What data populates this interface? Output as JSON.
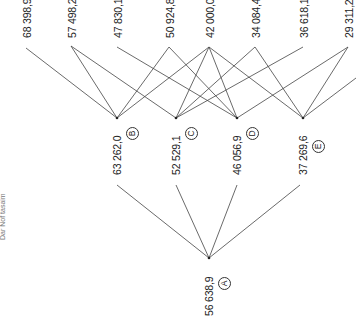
{
  "side_label": "Dar Nof tasaim",
  "top_values": [
    {
      "label": "68 398,9",
      "x": 26
    },
    {
      "label": "57 498,2",
      "x": 71
    },
    {
      "label": "47 830,1",
      "x": 117
    },
    {
      "label": "50 924,8",
      "x": 169
    },
    {
      "label": "42 000,0",
      "x": 209
    },
    {
      "label": "34 084,4",
      "x": 255
    },
    {
      "label": "36 618,1",
      "x": 303
    },
    {
      "label": "29 311,2",
      "x": 348
    }
  ],
  "middle_nodes": [
    {
      "id": "B",
      "value": "63 262,0",
      "x": 117
    },
    {
      "id": "C",
      "value": "52 529,1",
      "x": 176
    },
    {
      "id": "D",
      "value": "46 056,9",
      "x": 237
    },
    {
      "id": "E",
      "value": "37 269,6",
      "x": 303
    }
  ],
  "root_node": {
    "id": "A",
    "value": "56 638,9",
    "x": 209
  },
  "line_color": "#444444"
}
